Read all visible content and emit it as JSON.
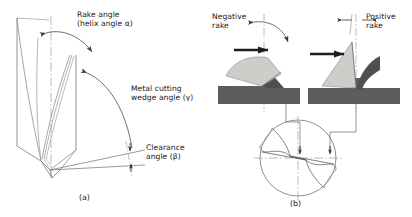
{
  "figure": {
    "background_color": "#ffffff",
    "line_color": "#5a5a5a",
    "dark_fill": "#5d5d5d",
    "light_fill": "#cdcdc9",
    "text_color": "#161616"
  },
  "panel_a": {
    "caption": "(a)",
    "labels": {
      "rake_line1": "Rake angle",
      "rake_line2": "(helix angle α)",
      "wedge_line1": "Metal cutting",
      "wedge_line2": "wedge angle (γ)",
      "clearance_line1": "Clearance",
      "clearance_line2": "angle (β)"
    },
    "icons": {
      "rake_arc": "arc-arrow-icon",
      "wedge_arc": "arc-arrow-icon",
      "clearance_dim": "dimension-arrow-icon",
      "center_line": "center-line-icon"
    }
  },
  "panel_b": {
    "caption": "(b)",
    "labels": {
      "negative_line1": "Negative",
      "negative_line2": "rake",
      "positive_line1": "Positive",
      "positive_line2": "rake"
    },
    "icons": {
      "feed_arrow_left": "feed-arrow-icon",
      "feed_arrow_right": "feed-arrow-icon",
      "negative_arc": "arc-arrow-icon",
      "positive_dim": "dimension-arrow-icon",
      "cross_section": "drill-cross-section-icon",
      "leader_left": "leader-line-icon",
      "leader_right": "leader-line-icon"
    }
  }
}
